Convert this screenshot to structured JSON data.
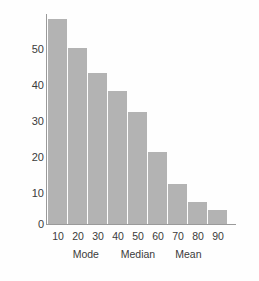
{
  "chart_data": {
    "type": "bar",
    "title": "",
    "subtitle": "",
    "xlabel": "",
    "ylabel": "",
    "categories": [
      "10",
      "20",
      "30",
      "40",
      "50",
      "60",
      "70",
      "80",
      "90"
    ],
    "values": [
      57,
      49,
      42,
      37,
      31,
      20,
      11,
      6,
      4
    ],
    "series": [
      {
        "name": "frequency",
        "values": [
          57,
          49,
          42,
          37,
          31,
          20,
          11,
          6,
          4
        ]
      }
    ],
    "ylim": [
      0,
      60
    ],
    "y_ticks": [
      0,
      10,
      20,
      30,
      40,
      50
    ],
    "y_tick_labels": [
      "0",
      "10",
      "20",
      "30",
      "40",
      "50"
    ],
    "x_tick_labels": [
      "10",
      "20",
      "30",
      "40",
      "50",
      "60",
      "70",
      "80",
      "90"
    ],
    "grid": false,
    "legend": null,
    "bar_color": "#b3b3b3",
    "axis_color": "#9a9a9a",
    "text_color": "#3b3b3b",
    "background": "#fefefe",
    "annotations": [
      {
        "label": "Mode",
        "x_position_pct": 21
      },
      {
        "label": "Median",
        "x_position_pct": 50
      },
      {
        "label": "Mean",
        "x_position_pct": 78
      }
    ]
  }
}
